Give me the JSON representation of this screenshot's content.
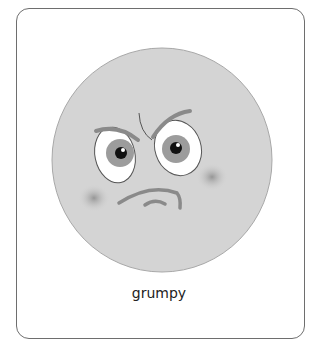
{
  "card": {
    "caption": "grumpy",
    "emotion_icon": "grumpy-face-icon"
  },
  "colors": {
    "face_fill": "#d4d4d4",
    "face_outline": "#a8a8a8",
    "feature_stroke": "#8a8a8a",
    "border": "#6e6e6e"
  }
}
